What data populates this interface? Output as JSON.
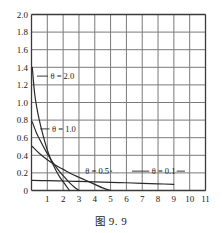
{
  "figure": {
    "caption_prefix": "图",
    "caption_number": "9. 9",
    "caption_full": "图 9.9"
  },
  "chart_data": {
    "type": "line",
    "title": "",
    "subtitle": "",
    "xlabel": "",
    "ylabel": "",
    "xlim": [
      0,
      11
    ],
    "ylim": [
      0,
      2.0
    ],
    "grid": true,
    "legend_position": "inline-annotations",
    "x_ticks": [
      1,
      2,
      3,
      4,
      5,
      6,
      7,
      8,
      9,
      10,
      11
    ],
    "x_tick_labels": [
      "1",
      "2",
      "3",
      "4",
      "5",
      "6",
      "7",
      "8",
      "9",
      "10",
      "11"
    ],
    "y_ticks": [
      0,
      0.2,
      0.4,
      0.6,
      0.8,
      1.0,
      1.2,
      1.4,
      1.6,
      1.8,
      2.0
    ],
    "y_tick_labels": [
      "0",
      "0.2",
      "0.4",
      "0.6",
      "0.8",
      "1.0",
      "1.2",
      "1.4",
      "1.6",
      "1.8",
      "2.0"
    ],
    "annotations": [
      {
        "text": "θ = 2.0",
        "x": 1.2,
        "y": 1.3
      },
      {
        "text": "θ = 1.0",
        "x": 1.3,
        "y": 0.7
      },
      {
        "text": "θ = 0.5",
        "x": 3.4,
        "y": 0.22
      },
      {
        "text": "θ = 0.1",
        "x": 7.6,
        "y": 0.22
      }
    ],
    "series": [
      {
        "name": "θ = 2.0",
        "theta": 2.0,
        "label": "θ = 2.0",
        "x": [
          0.05,
          0.2,
          0.4,
          0.6,
          0.8,
          1.0,
          1.2,
          1.4,
          1.6,
          1.8,
          2.0,
          2.2,
          2.4
        ],
        "values": [
          1.4,
          1.1,
          0.88,
          0.72,
          0.58,
          0.46,
          0.36,
          0.28,
          0.21,
          0.15,
          0.1,
          0.05,
          0.0
        ]
      },
      {
        "name": "θ = 1.0",
        "theta": 1.0,
        "label": "θ = 1.0",
        "x": [
          0.05,
          0.3,
          0.6,
          0.9,
          1.2,
          1.5,
          1.8,
          2.1,
          2.4,
          2.7,
          3.0
        ],
        "values": [
          0.78,
          0.66,
          0.55,
          0.45,
          0.36,
          0.28,
          0.21,
          0.15,
          0.09,
          0.04,
          0.0
        ]
      },
      {
        "name": "θ = 0.5",
        "theta": 0.5,
        "label": "θ = 0.5",
        "x": [
          0.05,
          0.5,
          1.0,
          1.5,
          2.0,
          2.5,
          3.0,
          3.5,
          4.0,
          4.5,
          5.0
        ],
        "values": [
          0.5,
          0.42,
          0.35,
          0.29,
          0.24,
          0.19,
          0.15,
          0.11,
          0.07,
          0.03,
          0.0
        ]
      },
      {
        "name": "θ = 0.1",
        "theta": 0.1,
        "label": "θ = 0.1",
        "x": [
          0.05,
          1.0,
          2.0,
          3.0,
          4.0,
          5.0,
          6.0,
          7.0,
          8.0,
          9.0
        ],
        "values": [
          0.115,
          0.112,
          0.108,
          0.103,
          0.098,
          0.093,
          0.088,
          0.082,
          0.076,
          0.07
        ]
      }
    ],
    "colors": {
      "curve": "#2a2a2a",
      "grid": "#7a7a7a",
      "axis": "#3a3a3a",
      "text": "#1a1a1a",
      "background": "#ffffff"
    }
  }
}
